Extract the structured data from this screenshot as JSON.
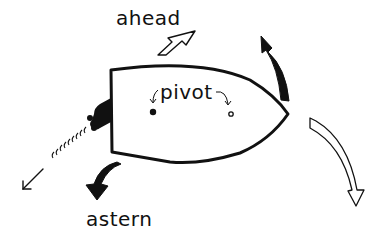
{
  "diagram": {
    "labels": {
      "ahead": "ahead",
      "pivot": "pivot",
      "astern": "astern"
    },
    "elements": [
      {
        "name": "hull",
        "description": "Top-down outline of ship hull, stern at left, bow pointing right"
      },
      {
        "name": "pivot-point-astern",
        "description": "Filled dot near stern marking pivot point when going astern"
      },
      {
        "name": "pivot-point-ahead",
        "description": "Small open circle near bow marking pivot point when going ahead"
      },
      {
        "name": "propeller",
        "description": "Black propeller/rudder at stern"
      },
      {
        "name": "propeller-wash",
        "description": "Wavy wash lines with arrow trailing down-left"
      },
      {
        "name": "ahead-arrow",
        "description": "Hollow arrow pointing up-right"
      },
      {
        "name": "astern-arrow",
        "description": "Solid black curved arrow pointing down-left"
      },
      {
        "name": "bow-swing-solid-arrow",
        "description": "Solid black curved arrow at bow pointing upward"
      },
      {
        "name": "bow-swing-hollow-arrow",
        "description": "Hollow curved arrow at bow pointing downward"
      }
    ],
    "colors": {
      "ink": "#111111",
      "background": "#ffffff"
    }
  }
}
